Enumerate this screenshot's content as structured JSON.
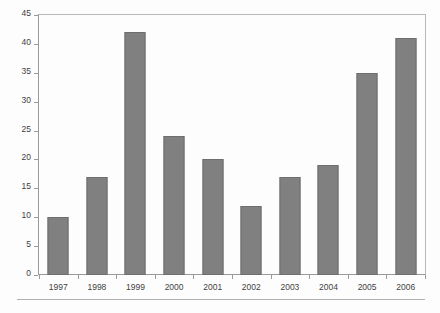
{
  "chart_data": {
    "type": "bar",
    "title": "",
    "subtitle": "",
    "xlabel": "",
    "ylabel": "",
    "categories": [
      "1997",
      "1998",
      "1999",
      "2000",
      "2001",
      "2002",
      "2003",
      "2004",
      "2005",
      "2006"
    ],
    "values": [
      10,
      17,
      42,
      24,
      20,
      12,
      17,
      19,
      35,
      41
    ],
    "series": [
      {
        "name": "",
        "values": [
          10,
          17,
          42,
          24,
          20,
          12,
          17,
          19,
          35,
          41
        ]
      }
    ],
    "ylim": [
      0,
      45
    ],
    "yticks": [
      0,
      5,
      10,
      15,
      20,
      25,
      30,
      35,
      40,
      45
    ],
    "ytick_labels": [
      "0",
      "5",
      "10",
      "15",
      "20",
      "25",
      "30",
      "35",
      "40",
      "45"
    ],
    "grid": false,
    "legend": false,
    "legend_position": "none",
    "annotations": [],
    "colors": {
      "bar_fill": "#808080",
      "bar_border": "#6e6e6e",
      "axis": "#9a9a9a",
      "frame": "#b9b9b9",
      "text": "#3f3f3f",
      "background": "#fdfdfd",
      "rule": "#b0b0b0"
    }
  },
  "figure": {
    "bottom_rule_present": true
  }
}
